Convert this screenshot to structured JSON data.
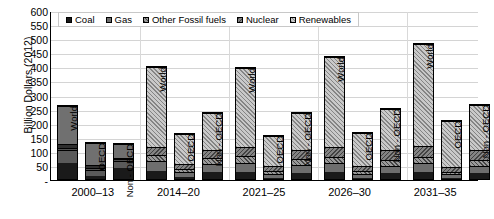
{
  "chart_data": {
    "type": "bar",
    "subtype": "stacked-bar-grouped",
    "title": "",
    "xlabel": "",
    "ylabel": "Billion Dollars (2012)",
    "ylim": [
      0,
      600
    ],
    "ytick_step": 50,
    "grid": true,
    "legend_position": "top-left-inside",
    "categories": [
      "2000–13",
      "2014–20",
      "2021–25",
      "2026–30",
      "2031–35"
    ],
    "subcategories": [
      "World",
      "OECD",
      "Non - OECD"
    ],
    "series_names": [
      "Coal",
      "Gas",
      "Other Fossil fuels",
      "Nuclear",
      "Renewables"
    ],
    "y_tick_labels": [
      "600",
      "550",
      "500",
      "450",
      "400",
      "350",
      "300",
      "250",
      "200",
      "150",
      "100",
      "50",
      "-"
    ],
    "y_tick_values": [
      600,
      550,
      500,
      450,
      400,
      350,
      300,
      250,
      200,
      150,
      100,
      50,
      0
    ],
    "groups": [
      {
        "category": "2000–13",
        "style": "solid",
        "bars": [
          {
            "label": "World",
            "total": 268,
            "values": [
              57,
              48,
              8,
              15,
              140
            ]
          },
          {
            "label": "OECD",
            "total": 135,
            "values": [
              10,
              24,
              7,
              10,
              84
            ]
          },
          {
            "label": "Non - OECD",
            "total": 133,
            "values": [
              41,
              27,
              6,
              6,
              53
            ]
          }
        ]
      },
      {
        "category": "2014–20",
        "style": "hatched",
        "bars": [
          {
            "label": "World",
            "total": 405,
            "values": [
              30,
              36,
              22,
              29,
              288
            ]
          },
          {
            "label": "OECD",
            "total": 167,
            "values": [
              6,
              19,
              13,
              17,
              112
            ]
          },
          {
            "label": "Non - OECD",
            "total": 240,
            "values": [
              24,
              32,
              22,
              30,
              132
            ]
          }
        ]
      },
      {
        "category": "2021–25",
        "style": "hatched",
        "bars": [
          {
            "label": "World",
            "total": 403,
            "values": [
              26,
              33,
              23,
              35,
              286
            ]
          },
          {
            "label": "OECD",
            "total": 160,
            "values": [
              5,
              13,
              12,
              18,
              112
            ]
          },
          {
            "label": "Non - OECD",
            "total": 243,
            "values": [
              22,
              29,
              23,
              33,
              136
            ]
          }
        ]
      },
      {
        "category": "2026–30",
        "style": "hatched",
        "bars": [
          {
            "label": "World",
            "total": 440,
            "values": [
              25,
              32,
              22,
              38,
              323
            ]
          },
          {
            "label": "OECD",
            "total": 172,
            "values": [
              5,
              13,
              11,
              18,
              125
            ]
          },
          {
            "label": "Non - OECD",
            "total": 255,
            "values": [
              21,
              28,
              22,
              35,
              149
            ]
          }
        ]
      },
      {
        "category": "2031–35",
        "style": "hatched",
        "bars": [
          {
            "label": "World",
            "total": 487,
            "values": [
              25,
              32,
              22,
              40,
              368
            ]
          },
          {
            "label": "OECD",
            "total": 212,
            "values": [
              5,
              12,
              10,
              17,
              168
            ]
          },
          {
            "label": "Non - OECD",
            "total": 270,
            "values": [
              21,
              27,
              22,
              36,
              164
            ]
          }
        ]
      }
    ],
    "colors": {
      "coal": "#1a1a1a",
      "gas": "#6e6e6e",
      "other_fossil_fuels": "#9a9a9a",
      "nuclear": "#848484",
      "renewables": "#c9c9c9",
      "gridline": "#d4d4d4",
      "axis": "#000000"
    }
  },
  "legend": {
    "items": [
      {
        "label": "Coal",
        "key": "coal"
      },
      {
        "label": "Gas",
        "key": "gas"
      },
      {
        "label": "Other Fossil fuels",
        "key": "other"
      },
      {
        "label": "Nuclear",
        "key": "nuclear"
      },
      {
        "label": "Renewables",
        "key": "renew"
      }
    ]
  }
}
